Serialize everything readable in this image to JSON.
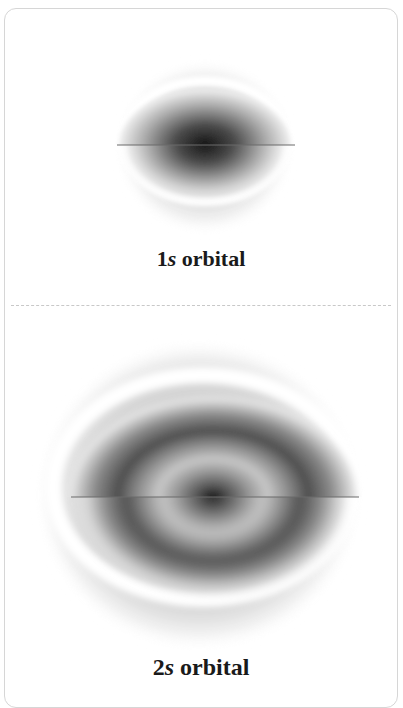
{
  "figure": {
    "panels": [
      {
        "id": "1s",
        "label_prefix": "1",
        "label_italic": "s",
        "label_suffix": " orbital",
        "description": "Cutaway spherical electron density of the 1s orbital, darkest at nucleus"
      },
      {
        "id": "2s",
        "label_prefix": "2",
        "label_italic": "s",
        "label_suffix": " orbital",
        "description": "Cutaway spherical electron density of the 2s orbital showing inner core, radial node and outer shell"
      }
    ]
  },
  "colors": {
    "border": "#d6d6d6",
    "divider": "#c8c8c8",
    "density_dark": "#1a1a1a",
    "density_mid": "#8a8a8a",
    "caption": "#1a1a1a"
  }
}
